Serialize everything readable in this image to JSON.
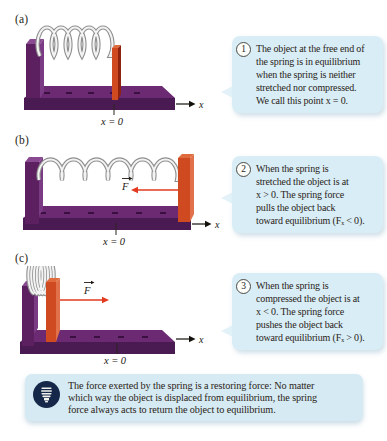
{
  "panels": [
    {
      "label": "(a)",
      "axis_label": "x",
      "origin_label": "x = 0"
    },
    {
      "label": "(b)",
      "axis_label": "x",
      "origin_label": "x = 0",
      "force_label": "F"
    },
    {
      "label": "(c)",
      "axis_label": "x",
      "origin_label": "x = 0",
      "force_label": "F"
    }
  ],
  "callouts": [
    {
      "number": "1",
      "lines": [
        "The object at the free end of",
        "the spring is in equilibrium",
        "when the spring is neither",
        "stretched nor compressed.",
        "We call this point x = 0."
      ]
    },
    {
      "number": "2",
      "lines": [
        "When the spring is",
        "stretched the object is at",
        "x > 0. The spring force",
        "pulls the object back",
        "toward equilibrium (Fₓ < 0)."
      ]
    },
    {
      "number": "3",
      "lines": [
        "When the spring is",
        "compressed the object is at",
        "x < 0. The spring force",
        "pushes the object back",
        "toward equilibrium (Fₓ > 0)."
      ]
    }
  ],
  "key_idea": {
    "icon": "lightbulb-icon",
    "lines": [
      "The force exerted by the spring is a restoring force: No matter",
      "which way the object is displaced from equilibrium, the spring",
      "force always acts to return the object to equilibrium."
    ]
  },
  "colors": {
    "callout_bg": "#d8edf6",
    "key_idea_bg": "#d5eaf3",
    "track_purple": "#5c2060",
    "track_purple_dark": "#421549",
    "track_purple_light": "#7a3a84",
    "object_red": "#cf4a21",
    "object_red_dark": "#8e2410",
    "force_arrow_red": "#e2391f",
    "icon_navy": "#16284a",
    "spring_gray": "#8f8f8f"
  }
}
